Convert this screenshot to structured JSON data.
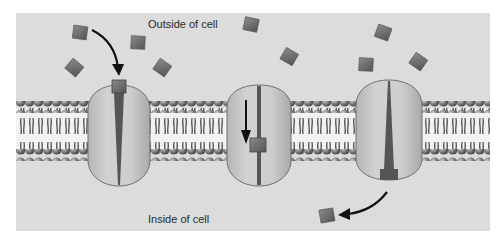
{
  "diagram": {
    "labels": {
      "outside": "Outside of cell",
      "inside": "Inside of cell"
    },
    "colors": {
      "background": "#ffffff",
      "panel": "#dcdcdc",
      "protein_fill": "#c9c9c9",
      "protein_outline": "#6e6e6e",
      "channel": "#555555",
      "molecule": "#6b6b6b",
      "lipid_head": "#777777",
      "lipid_tail": "#3a3a3a",
      "arrow": "#111111"
    },
    "elements": {
      "membrane": "Phospholipid bilayer",
      "proteins": [
        {
          "name": "Transport protein (open to outside, molecule binding)",
          "state": "molecule entering"
        },
        {
          "name": "Transport protein (molecule moving through channel)",
          "state": "molecule in transit"
        },
        {
          "name": "Transport protein (open to inside, molecule released)",
          "state": "molecule released"
        }
      ],
      "molecules_outside_count": 10,
      "molecules_inside_count": 1
    }
  }
}
